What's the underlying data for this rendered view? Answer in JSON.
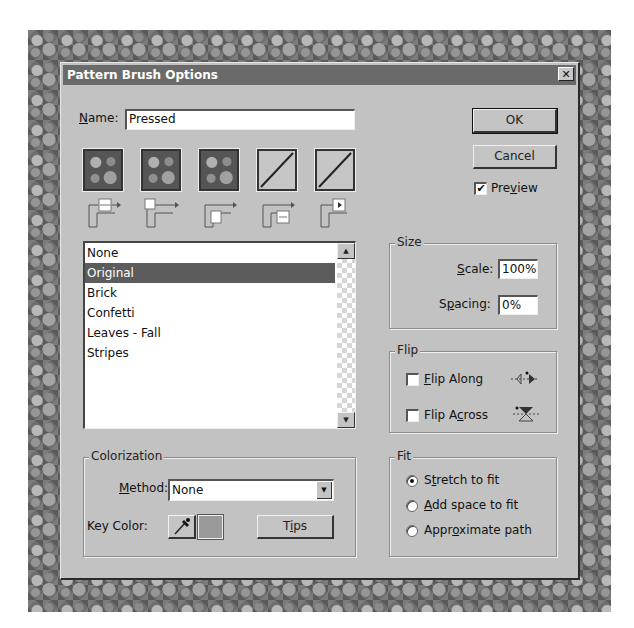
{
  "dialog": {
    "title": "Pattern Brush Options",
    "close_glyph": "✕"
  },
  "name": {
    "label": "Name:",
    "label_accesskey": "N",
    "label_rest": "ame:",
    "value": "Pressed"
  },
  "buttons": {
    "ok": "OK",
    "cancel": "Cancel",
    "tips": "Tips"
  },
  "preview": {
    "label_pre": "Pre",
    "label_u": "v",
    "label_post": "iew",
    "checked": true,
    "check_glyph": "✔"
  },
  "tiles": [
    {
      "name": "side-tile",
      "kind": "pattern"
    },
    {
      "name": "outer-corner-tile",
      "kind": "pattern"
    },
    {
      "name": "inner-corner-tile",
      "kind": "pattern"
    },
    {
      "name": "start-tile",
      "kind": "empty"
    },
    {
      "name": "end-tile",
      "kind": "empty"
    }
  ],
  "pattern_list": {
    "items": [
      "None",
      "Original",
      "Brick",
      "Confetti",
      "Leaves - Fall",
      "Stripes"
    ],
    "selected_index": 1,
    "scroll_up_glyph": "▲",
    "scroll_down_glyph": "▼"
  },
  "size": {
    "title": "Size",
    "scale_label_u": "S",
    "scale_label_rest": "cale:",
    "scale_value": "100%",
    "spacing_label_pre": "S",
    "spacing_label_u": "p",
    "spacing_label_rest": "acing:",
    "spacing_value": "0%"
  },
  "flip": {
    "title": "Flip",
    "along_u": "F",
    "along_rest": "lip Along",
    "along_checked": false,
    "across_pre": "Flip A",
    "across_u": "c",
    "across_rest": "ross",
    "across_checked": false
  },
  "fit": {
    "title": "Fit",
    "options": [
      {
        "pre": "S",
        "u": "t",
        "post": "retch to fit",
        "checked": true
      },
      {
        "pre": "",
        "u": "A",
        "post": "dd space to fit",
        "checked": false
      },
      {
        "pre": "Appr",
        "u": "o",
        "post": "ximate path",
        "checked": false
      }
    ]
  },
  "colorization": {
    "title": "Colorization",
    "method_u": "M",
    "method_rest": "ethod:",
    "method_value": "None",
    "key_color_label": "Key Color:",
    "key_color_swatch": "#9a9a9a",
    "tips_pre": "T",
    "tips_u": "i",
    "tips_post": "ps"
  }
}
